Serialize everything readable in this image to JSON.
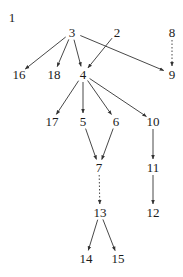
{
  "diagram": {
    "type": "directed-graph",
    "nodes": [
      {
        "id": "1",
        "label": "1",
        "x": 12,
        "y": 17
      },
      {
        "id": "2",
        "label": "2",
        "x": 117,
        "y": 32
      },
      {
        "id": "3",
        "label": "3",
        "x": 72,
        "y": 32
      },
      {
        "id": "4",
        "label": "4",
        "x": 83,
        "y": 74
      },
      {
        "id": "5",
        "label": "5",
        "x": 83,
        "y": 121
      },
      {
        "id": "6",
        "label": "6",
        "x": 116,
        "y": 121
      },
      {
        "id": "7",
        "label": "7",
        "x": 99,
        "y": 167
      },
      {
        "id": "8",
        "label": "8",
        "x": 172,
        "y": 32
      },
      {
        "id": "9",
        "label": "9",
        "x": 172,
        "y": 74
      },
      {
        "id": "10",
        "label": "10",
        "x": 153,
        "y": 121
      },
      {
        "id": "11",
        "label": "11",
        "x": 153,
        "y": 167
      },
      {
        "id": "12",
        "label": "12",
        "x": 153,
        "y": 212
      },
      {
        "id": "13",
        "label": "13",
        "x": 100,
        "y": 212
      },
      {
        "id": "14",
        "label": "14",
        "x": 86,
        "y": 258
      },
      {
        "id": "15",
        "label": "15",
        "x": 118,
        "y": 258
      },
      {
        "id": "16",
        "label": "16",
        "x": 19,
        "y": 74
      },
      {
        "id": "17",
        "label": "17",
        "x": 52,
        "y": 121
      },
      {
        "id": "18",
        "label": "18",
        "x": 54,
        "y": 74
      }
    ],
    "edges": [
      {
        "from": "3",
        "to": "16",
        "style": "solid"
      },
      {
        "from": "3",
        "to": "18",
        "style": "solid"
      },
      {
        "from": "3",
        "to": "4",
        "style": "solid"
      },
      {
        "from": "3",
        "to": "9",
        "style": "solid"
      },
      {
        "from": "2",
        "to": "4",
        "style": "solid"
      },
      {
        "from": "8",
        "to": "9",
        "style": "dashed"
      },
      {
        "from": "4",
        "to": "17",
        "style": "solid"
      },
      {
        "from": "4",
        "to": "5",
        "style": "solid"
      },
      {
        "from": "4",
        "to": "6",
        "style": "solid"
      },
      {
        "from": "4",
        "to": "10",
        "style": "solid"
      },
      {
        "from": "5",
        "to": "7",
        "style": "solid"
      },
      {
        "from": "6",
        "to": "7",
        "style": "solid"
      },
      {
        "from": "10",
        "to": "11",
        "style": "solid"
      },
      {
        "from": "11",
        "to": "12",
        "style": "solid"
      },
      {
        "from": "7",
        "to": "13",
        "style": "dashed"
      },
      {
        "from": "13",
        "to": "14",
        "style": "solid"
      },
      {
        "from": "13",
        "to": "15",
        "style": "solid"
      }
    ],
    "colors": {
      "edge": "#333333",
      "label": "#1a1a1a",
      "background": "#ffffff"
    }
  }
}
